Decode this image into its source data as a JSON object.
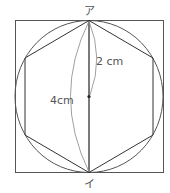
{
  "diagram": {
    "title": "",
    "vertex_top": "ア",
    "vertex_bottom": "イ",
    "radius_label": "2 cm",
    "diameter_label": "4cm",
    "shapes": [
      "square",
      "circle",
      "regular-hexagon",
      "diameter-segment",
      "center-point"
    ],
    "colors": {
      "stroke": "#555555",
      "text": "#555555",
      "background": "#ffffff"
    }
  }
}
